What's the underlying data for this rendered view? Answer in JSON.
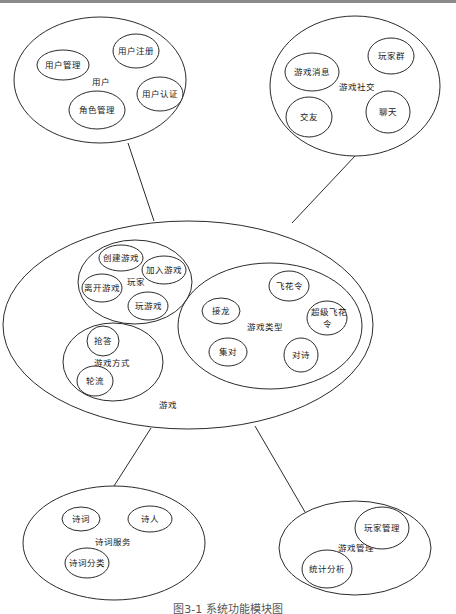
{
  "figure": {
    "caption": "图3-1 系统功能模块图",
    "colors": {
      "stroke": "#2b2b2b",
      "text": "#1a1a1a",
      "background": "#ffffff",
      "top_rule": "#8a8a8a"
    }
  },
  "modules": {
    "user": {
      "label": "用户",
      "children": [
        "用户管理",
        "用户注册",
        "用户认证",
        "角色管理"
      ]
    },
    "social": {
      "label": "游戏社交",
      "children": [
        "游戏消息",
        "玩家群",
        "交友",
        "聊天"
      ]
    },
    "game": {
      "label": "游戏",
      "player": {
        "label": "玩家",
        "children": [
          "创建游戏",
          "加入游戏",
          "离开游戏",
          "玩游戏"
        ]
      },
      "mode": {
        "label": "游戏方式",
        "children": [
          "抢答",
          "轮流"
        ]
      },
      "type": {
        "label": "游戏类型",
        "children": [
          "接龙",
          "飞花令",
          "超级飞花",
          "令",
          "集对",
          "对诗"
        ]
      }
    },
    "poetry": {
      "label": "诗词服务",
      "children": [
        "诗词",
        "诗人",
        "诗词分类"
      ]
    },
    "admin": {
      "label": "游戏管理",
      "children": [
        "玩家管理",
        "统计分析"
      ]
    }
  },
  "links": [
    {
      "from": "用户",
      "to": "游戏"
    },
    {
      "from": "游戏社交",
      "to": "游戏"
    },
    {
      "from": "游戏",
      "to": "诗词服务"
    },
    {
      "from": "游戏",
      "to": "游戏管理"
    }
  ]
}
